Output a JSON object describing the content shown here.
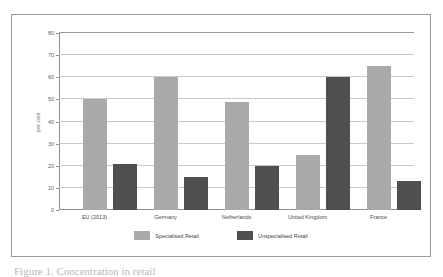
{
  "chart_data": {
    "type": "bar",
    "title": "",
    "xlabel": "",
    "ylabel": "per cent",
    "ylim": [
      0,
      80
    ],
    "yticks": [
      0,
      10,
      20,
      30,
      40,
      50,
      60,
      70,
      80
    ],
    "grid": true,
    "legend_position": "bottom",
    "categories": [
      "EU (2013)",
      "Germany",
      "Netherlands",
      "United Kingdom",
      "France"
    ],
    "series": [
      {
        "name": "Specialised Retail",
        "color": "#a9a9a9",
        "values": [
          50,
          60,
          49,
          25,
          65
        ]
      },
      {
        "name": "Unspecialised Retail",
        "color": "#4f4f4f",
        "values": [
          21,
          15,
          20,
          60,
          13
        ]
      }
    ]
  },
  "caption": {
    "text": "Figure 1. Concentration in retail"
  }
}
